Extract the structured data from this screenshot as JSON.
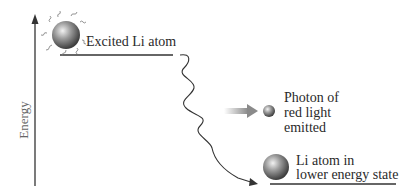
{
  "diagram": {
    "axis": {
      "label": "Energy",
      "direction": "up"
    },
    "states": [
      {
        "id": "excited",
        "label": "Excited Li atom"
      },
      {
        "id": "lower",
        "label_lines": [
          "Li atom in",
          "lower energy state"
        ]
      }
    ],
    "photon": {
      "label_lines": [
        "Photon of",
        "red light",
        "emitted"
      ]
    },
    "colors": {
      "line": "#333333",
      "atom_gray": "#7a7a7a",
      "arrow_gray": "#9a9a9a",
      "text": "#2a2a2a",
      "axis_label": "#666666"
    }
  }
}
